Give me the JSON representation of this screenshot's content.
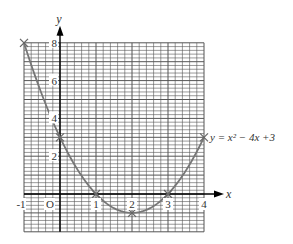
{
  "chart_data": {
    "type": "line",
    "title": "",
    "equation_label": "y = x² − 4x +3",
    "xlabel": "x",
    "ylabel": "y",
    "origin_label": "O",
    "xlim": [
      -1,
      4
    ],
    "ylim": [
      -2,
      8
    ],
    "x_ticks": [
      "-1",
      "1",
      "2",
      "3",
      "4"
    ],
    "y_ticks": [
      "2",
      "4",
      "6",
      "8"
    ],
    "grid": true,
    "minor_per_unit": 5,
    "series": [
      {
        "name": "y = x^2 - 4x + 3",
        "x": [
          -1,
          0,
          1,
          2,
          3,
          4
        ],
        "y": [
          8,
          3,
          0,
          -1,
          0,
          3
        ],
        "marker": "x"
      }
    ],
    "colors": {
      "curve": "#777777",
      "grid": "#555555",
      "axis": "#000000"
    }
  }
}
